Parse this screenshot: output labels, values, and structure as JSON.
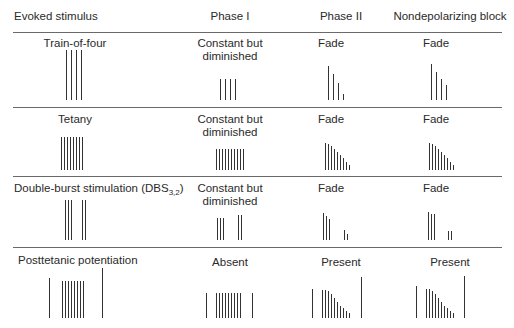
{
  "headers": [
    "Evoked stimulus",
    "Phase I",
    "Phase II",
    "Nondepolarizing block"
  ],
  "rows": [
    {
      "stimulus": "Train-of-four",
      "phase1": [
        "Constant but",
        "diminished"
      ],
      "phase2": "Fade",
      "nondep": "Fade"
    },
    {
      "stimulus": "Tetany",
      "phase1": [
        "Constant but",
        "diminished"
      ],
      "phase2": "Fade",
      "nondep": "Fade"
    },
    {
      "stimulus_main": "Double-burst stimulation (DBS",
      "stimulus_sub": "3,2",
      "stimulus_end": ")",
      "phase1": [
        "Constant but",
        "diminished"
      ],
      "phase2": "Fade",
      "nondep": "Fade"
    },
    {
      "stimulus": "Posttetanic potentiation",
      "phase1": "Absent",
      "phase2": "Present",
      "nondep": "Present"
    }
  ],
  "glyphs": {
    "tof_control": {
      "x": [
        66,
        71,
        76,
        81
      ],
      "h": [
        50,
        50,
        50,
        50
      ],
      "base": 100
    },
    "tof_phase1": {
      "x": [
        220,
        225,
        230,
        235
      ],
      "h": [
        21,
        21,
        21,
        21
      ],
      "base": 100
    },
    "tof_phase2": {
      "x": [
        328,
        333,
        338,
        343
      ],
      "h": [
        34,
        26,
        17,
        6
      ],
      "base": 100
    },
    "tof_nondep": {
      "x": [
        431,
        436,
        441,
        446
      ],
      "h": [
        36,
        28,
        21,
        15
      ],
      "base": 100
    },
    "tet_control": {
      "x": [
        61,
        64,
        67,
        70,
        73,
        76,
        79,
        82
      ],
      "h": [
        33,
        33,
        33,
        33,
        33,
        33,
        33,
        33
      ],
      "base": 170
    },
    "tet_phase1": {
      "x": [
        216,
        219,
        222,
        225,
        228,
        231,
        234,
        237,
        240,
        243
      ],
      "h": [
        21,
        21,
        21,
        21,
        21,
        21,
        21,
        21,
        21,
        21
      ],
      "base": 170
    },
    "tet_phase2": {
      "x": [
        325,
        328,
        331,
        334,
        337,
        340,
        343,
        346,
        349
      ],
      "h": [
        27,
        26,
        24,
        21,
        18,
        15,
        12,
        8,
        5
      ],
      "base": 170
    },
    "tet_nondep": {
      "x": [
        429,
        432,
        435,
        438,
        441,
        444,
        447,
        450,
        453
      ],
      "h": [
        27,
        26,
        24,
        21,
        18,
        15,
        12,
        8,
        5
      ],
      "base": 170
    },
    "dbs_control": {
      "x": [
        65,
        68,
        71,
        82,
        85
      ],
      "h": [
        40,
        40,
        40,
        40,
        40
      ],
      "base": 240
    },
    "dbs_phase1": {
      "x": [
        217,
        220,
        223,
        238,
        241
      ],
      "h": [
        22,
        22,
        22,
        25,
        25
      ],
      "base": 240
    },
    "dbs_phase2": {
      "x": [
        323,
        326,
        329,
        344,
        347
      ],
      "h": [
        27,
        24,
        21,
        10,
        6
      ],
      "base": 240
    },
    "dbs_nondep": {
      "x": [
        428,
        431,
        434,
        448,
        451
      ],
      "h": [
        28,
        26,
        26,
        9,
        9
      ],
      "base": 240
    },
    "ptp_control": {
      "x": [
        49,
        62,
        65,
        68,
        71,
        74,
        77,
        80,
        83,
        102
      ],
      "h": [
        40,
        37,
        37,
        37,
        37,
        37,
        37,
        37,
        37,
        50
      ],
      "base": 318
    },
    "ptp_phase1": {
      "x": [
        206,
        216,
        219,
        222,
        225,
        228,
        231,
        234,
        237,
        240,
        252
      ],
      "h": [
        25,
        25,
        25,
        25,
        25,
        25,
        25,
        25,
        25,
        25,
        25
      ],
      "base": 318
    },
    "ptp_phase2": {
      "x": [
        312,
        322,
        325,
        328,
        331,
        334,
        337,
        340,
        343,
        346,
        349,
        361
      ],
      "h": [
        29,
        28,
        28,
        27,
        24,
        20,
        16,
        12,
        10,
        7,
        5,
        41
      ],
      "base": 318
    },
    "ptp_nondep": {
      "x": [
        416,
        426,
        429,
        432,
        435,
        438,
        441,
        444,
        447,
        450,
        453,
        464
      ],
      "h": [
        32,
        29,
        29,
        27,
        24,
        20,
        16,
        12,
        10,
        7,
        5,
        42
      ],
      "base": 318
    }
  },
  "colors": {
    "bar": "#333333",
    "rule": "#6a6a6a",
    "text": "#2a2a2a"
  }
}
